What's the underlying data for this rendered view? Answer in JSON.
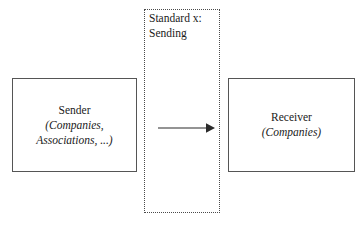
{
  "diagram": {
    "channel": {
      "label": "Standard x:\nSending",
      "border_color": "#4a4a4a",
      "border_style": "dotted"
    },
    "nodes": [
      {
        "id": "sender",
        "title": "Sender",
        "subtitle": "(Companies,\nAssociations, ...)",
        "border_color": "#555555",
        "fill_color": "#ffffff"
      },
      {
        "id": "receiver",
        "title": "Receiver",
        "subtitle": "(Companies)",
        "border_color": "#555555",
        "fill_color": "#ffffff"
      }
    ],
    "connector": {
      "from": "sender",
      "to": "receiver",
      "style": "solid-arrow",
      "color": "#2b2b2b"
    },
    "background_color": "#ffffff",
    "text_color": "#1a1a1a"
  }
}
